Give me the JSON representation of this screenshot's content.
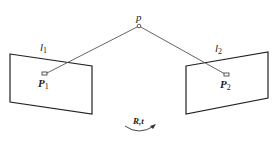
{
  "diagram": {
    "type": "epipolar-geometry",
    "point": {
      "label": "p"
    },
    "planes": [
      {
        "id": "image-plane-1",
        "line_label": "l",
        "line_sub": "1",
        "point_label": "P",
        "point_sub": "1"
      },
      {
        "id": "image-plane-2",
        "line_label": "l",
        "line_sub": "2",
        "point_label": "P",
        "point_sub": "2"
      }
    ],
    "transform": {
      "label": "R,t"
    },
    "colors": {
      "stroke": "#222222",
      "ray": "#555555",
      "background": "#ffffff"
    }
  }
}
